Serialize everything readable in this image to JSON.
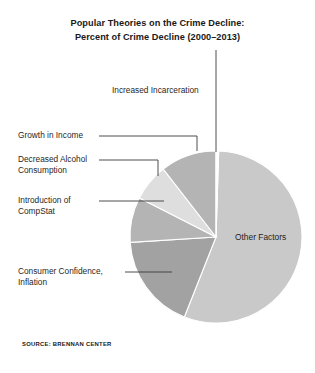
{
  "title": {
    "line1": "Popular Theories on the Crime Decline:",
    "line2": "Percent of Crime Decline (2000–2013)"
  },
  "source": "SOURCE: BRENNAN CENTER",
  "labels": {
    "increased_incarceration": "Increased Incarceration",
    "growth_in_income": "Growth in Income",
    "decreased_alcohol": "Decreased Alcohol\nConsumption",
    "compstat": "Introduction of\nCompStat",
    "consumer_confidence": "Consumer Confidence,\nInflation",
    "other_factors": "Other Factors"
  },
  "colors": {
    "other_factors": "#c9c9c9",
    "consumer_confidence": "#a2a2a2",
    "compstat": "#b4b4b4",
    "decreased_alcohol": "#dedede",
    "growth_in_income": "#b4b4b4",
    "increased_incarceration": "#ffffff",
    "leader_line": "#3a3a3a",
    "text": "#1f1f1f",
    "background": "#ffffff"
  },
  "chart_data": {
    "type": "pie",
    "title": "Popular Theories on the Crime Decline: Percent of Crime Decline (2000–2013)",
    "legend_position": "callout-labels",
    "grid": false,
    "units": "percent",
    "categories": [
      "Other Factors",
      "Consumer Confidence, Inflation",
      "Introduction of CompStat",
      "Decreased Alcohol Consumption",
      "Growth in Income",
      "Increased Incarceration"
    ],
    "values": [
      55.5,
      18.0,
      8.5,
      7.0,
      10.5,
      0.5
    ],
    "slices": [
      {
        "label": "Other Factors",
        "value": 55.5,
        "start_angle": 1.8,
        "end_angle": 201.6,
        "color": "#c9c9c9"
      },
      {
        "label": "Consumer Confidence, Inflation",
        "value": 18.0,
        "start_angle": 201.6,
        "end_angle": 266.4,
        "color": "#a2a2a2"
      },
      {
        "label": "Introduction of CompStat",
        "value": 8.5,
        "start_angle": 266.4,
        "end_angle": 297.0,
        "color": "#b4b4b4"
      },
      {
        "label": "Decreased Alcohol Consumption",
        "value": 7.0,
        "start_angle": 297.0,
        "end_angle": 322.2,
        "color": "#dedede"
      },
      {
        "label": "Growth in Income",
        "value": 10.5,
        "start_angle": 322.2,
        "end_angle": 360.0,
        "color": "#b4b4b4"
      },
      {
        "label": "Increased Incarceration",
        "value": 0.5,
        "start_angle": 360.0,
        "end_angle": 361.8,
        "color": "#ffffff"
      }
    ]
  }
}
